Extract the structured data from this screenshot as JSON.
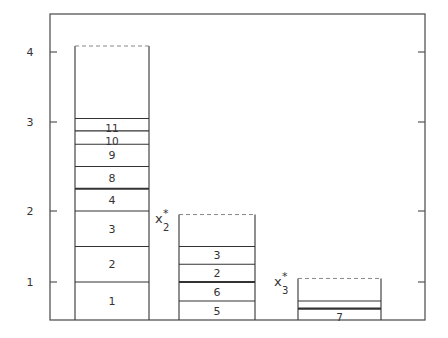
{
  "chart_data": {
    "type": "bar",
    "title": "",
    "xlabel": "",
    "ylabel": "",
    "ylim": [
      0.5,
      4.45
    ],
    "y_ticks": [
      {
        "value": 1,
        "label": "1"
      },
      {
        "value": 2,
        "label": "2"
      },
      {
        "value": 3,
        "label": "3"
      },
      {
        "value": 4,
        "label": "4"
      }
    ],
    "grid": false,
    "bins": [
      {
        "name": "bin-1",
        "capacity": 4.1,
        "side_label": "",
        "items": [
          {
            "label": "1",
            "from": 0.5,
            "to": 1.0,
            "bold_top": false
          },
          {
            "label": "2",
            "from": 1.0,
            "to": 1.5,
            "bold_top": false
          },
          {
            "label": "3",
            "from": 1.5,
            "to": 2.0,
            "bold_top": false
          },
          {
            "label": "4",
            "from": 2.0,
            "to": 2.25,
            "bold_top": true
          },
          {
            "label": "8",
            "from": 2.25,
            "to": 2.5,
            "bold_top": false
          },
          {
            "label": "9",
            "from": 2.5,
            "to": 2.75,
            "bold_top": false
          },
          {
            "label": "10",
            "from": 2.75,
            "to": 2.9,
            "bold_top": false
          },
          {
            "label": "11",
            "from": 2.9,
            "to": 3.05,
            "bold_top": false
          }
        ]
      },
      {
        "name": "bin-2",
        "capacity": 1.95,
        "side_label": {
          "base": "x",
          "sub": "2",
          "sup": "*"
        },
        "items": [
          {
            "label": "5",
            "from": 0.5,
            "to": 0.75,
            "bold_top": false
          },
          {
            "label": "6",
            "from": 0.75,
            "to": 1.0,
            "bold_top": true
          },
          {
            "label": "2",
            "from": 1.0,
            "to": 1.25,
            "bold_top": false
          },
          {
            "label": "3",
            "from": 1.25,
            "to": 1.5,
            "bold_top": false
          }
        ]
      },
      {
        "name": "bin-3",
        "capacity": 1.05,
        "side_label": {
          "base": "x",
          "sub": "3",
          "sup": "*"
        },
        "items": [
          {
            "label": "7",
            "from": 0.5,
            "to": 0.65,
            "bold_top": true
          },
          {
            "label": "",
            "from": 0.65,
            "to": 0.75,
            "bold_top": false
          }
        ]
      }
    ]
  }
}
